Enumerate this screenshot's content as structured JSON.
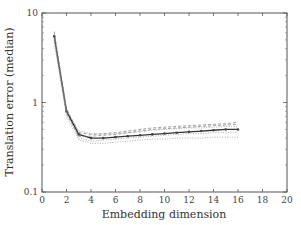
{
  "chart_data": {
    "type": "line",
    "title": "",
    "xlabel": "Embedding dimension",
    "ylabel": "Translation error (median)",
    "xlim": [
      0,
      20
    ],
    "ylim": [
      0.1,
      10
    ],
    "yscale": "log",
    "x_ticks": [
      "0",
      "2",
      "4",
      "6",
      "8",
      "10",
      "12",
      "14",
      "16",
      "18",
      "20"
    ],
    "y_ticks": [
      "0.1",
      "1",
      "10"
    ],
    "grid": false,
    "legend": "none",
    "x": [
      1,
      2,
      3,
      4,
      5,
      6,
      7,
      8,
      9,
      10,
      11,
      12,
      13,
      14,
      15,
      16
    ],
    "series": [
      {
        "name": "median (solid, markers)",
        "style": "solid",
        "values": [
          5.5,
          0.8,
          0.44,
          0.4,
          0.4,
          0.41,
          0.42,
          0.43,
          0.44,
          0.45,
          0.46,
          0.47,
          0.48,
          0.49,
          0.5,
          0.5
        ]
      },
      {
        "name": "run 2",
        "style": "dashed",
        "values": [
          5.0,
          0.75,
          0.42,
          0.42,
          0.43,
          0.44,
          0.46,
          0.48,
          0.5,
          0.51,
          0.52,
          0.53,
          0.54,
          0.55,
          0.56,
          0.57
        ]
      },
      {
        "name": "run 3",
        "style": "dashed",
        "values": [
          6.2,
          0.85,
          0.46,
          0.44,
          0.45,
          0.46,
          0.48,
          0.5,
          0.52,
          0.53,
          0.54,
          0.55,
          0.56,
          0.57,
          0.58,
          0.6
        ]
      },
      {
        "name": "run 4",
        "style": "dotted",
        "values": [
          4.6,
          0.7,
          0.38,
          0.35,
          0.35,
          0.36,
          0.37,
          0.38,
          0.39,
          0.39,
          0.4,
          0.4,
          0.4,
          0.41,
          0.41,
          0.41
        ]
      },
      {
        "name": "run 5",
        "style": "dotted",
        "values": [
          5.8,
          0.78,
          0.4,
          0.37,
          0.38,
          0.39,
          0.4,
          0.41,
          0.42,
          0.43,
          0.44,
          0.45,
          0.45,
          0.46,
          0.46,
          0.47
        ]
      },
      {
        "name": "run 6",
        "style": "dotted",
        "values": [
          5.2,
          0.82,
          0.48,
          0.45,
          0.44,
          0.45,
          0.46,
          0.47,
          0.49,
          0.5,
          0.51,
          0.52,
          0.52,
          0.53,
          0.54,
          0.54
        ]
      }
    ]
  }
}
